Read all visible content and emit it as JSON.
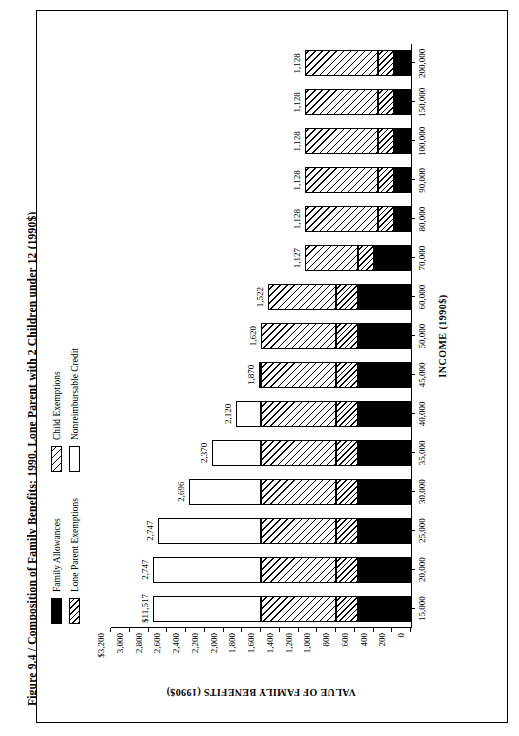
{
  "figure": {
    "caption": "Figure 9.4  /  Composition of Family Benefits: 1990, Lone Parent with 2 Children under 12 (1990$)"
  },
  "legend": {
    "items": [
      {
        "label": "Family Allowances",
        "pattern": "solid-black"
      },
      {
        "label": "Lone Parent Exemptions",
        "pattern": "dense-diagonal-hatch"
      },
      {
        "label": "Child Exemptions",
        "pattern": "diagonal-hatch"
      },
      {
        "label": "Nonreimbursable Credit",
        "pattern": "white"
      }
    ]
  },
  "chart_data": {
    "type": "bar",
    "stacked": true,
    "title": "Figure 9.4  /  Composition of Family Benefits: 1990, Lone Parent with 2 Children under 12 (1990$)",
    "xlabel": "INCOME (1990$)",
    "ylabel": "VALUE OF FAMILY BENEFITS (1990$)",
    "ylim": [
      0,
      3200
    ],
    "yticks": [
      0,
      200,
      400,
      600,
      800,
      1000,
      1200,
      1400,
      1600,
      1800,
      2000,
      2200,
      2400,
      2600,
      2800,
      3000,
      3200
    ],
    "ytick_labels": [
      "0",
      "200",
      "400",
      "600",
      "800",
      "1,000",
      "1,200",
      "1,400",
      "1,600",
      "1,800",
      "2,000",
      "2,200",
      "2,400",
      "2,600",
      "2,800",
      "3,000",
      "$3,200"
    ],
    "xticks": [
      15000,
      20000,
      25000,
      30000,
      35000,
      40000,
      45000,
      50000,
      60000,
      70000,
      80000,
      90000,
      100000,
      150000,
      200000
    ],
    "xtick_labels": [
      "15,000",
      "20,000",
      "25,000",
      "30,000",
      "35,000",
      "40,000",
      "45,000",
      "50,000",
      "60,000",
      "70,000",
      "80,000",
      "90,000",
      "100,000",
      "150,000",
      "200,000"
    ],
    "categories": [
      "15,000",
      "20,000",
      "25,000",
      "30,000",
      "35,000",
      "40,000",
      "45,000",
      "50,000",
      "60,000",
      "70,000",
      "80,000",
      "90,000",
      "100,000",
      "150,000",
      "200,000"
    ],
    "totals": [
      11517,
      2747,
      2747,
      2696,
      2370,
      2120,
      1870,
      1620,
      1522,
      1127,
      1128,
      1128,
      1128,
      1128,
      1128,
      1128
    ],
    "total_labels": [
      "$11,517",
      "2,747",
      "2,747",
      "2,696",
      "2,370",
      "2,120",
      "1,870",
      "1,620",
      "1,522",
      "1,127",
      "1,128",
      "1,128",
      "1,128",
      "1,128",
      "1,128"
    ],
    "series": [
      {
        "name": "Family Allowances",
        "values": [
          570,
          570,
          570,
          570,
          570,
          570,
          570,
          570,
          570,
          400,
          185,
          185,
          185,
          185,
          185
        ]
      },
      {
        "name": "Lone Parent Exemptions",
        "values": [
          230,
          230,
          230,
          230,
          230,
          230,
          230,
          230,
          230,
          165,
          165,
          165,
          165,
          165,
          165
        ]
      },
      {
        "name": "Child Exemptions",
        "values": [
          800,
          800,
          800,
          800,
          800,
          800,
          800,
          800,
          722,
          562,
          778,
          778,
          778,
          778,
          778
        ]
      },
      {
        "name": "Nonreimbursable Credit",
        "values": [
          1147,
          1147,
          1096,
          770,
          520,
          270,
          20,
          0,
          0,
          0,
          0,
          0,
          0,
          0,
          0
        ]
      }
    ]
  }
}
